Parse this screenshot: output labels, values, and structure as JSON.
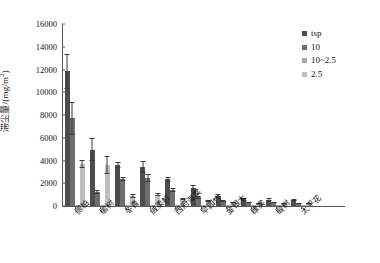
{
  "chart_data": {
    "type": "bar",
    "title": "",
    "xlabel": "",
    "ylabel": "滞尘量/(mg/m2)",
    "ylabel_base": "滞尘量/(mg/m",
    "ylabel_sup": "2",
    "ylabel_tail": ")",
    "ylim": [
      0,
      16000
    ],
    "ytick_labels": [
      "0",
      "2000",
      "4000",
      "6000",
      "8000",
      "10000",
      "12000",
      "14000",
      "16000"
    ],
    "ytick_values": [
      0,
      2000,
      4000,
      6000,
      8000,
      10000,
      12000,
      14000,
      16000
    ],
    "grid": false,
    "legend_position": "top-right",
    "categories": [
      "侧柏",
      "榆树",
      "冬青",
      "绒柔杉",
      "西府海棠",
      "早园竹",
      "金银木",
      "棣棠",
      "椴树",
      "太平花"
    ],
    "series": [
      {
        "name": "tsp",
        "color": "#4d4d4d",
        "values": [
          11850,
          4950,
          3600,
          3450,
          2350,
          1600,
          900,
          600,
          560,
          520
        ],
        "errors": [
          1550,
          1000,
          250,
          550,
          200,
          250,
          150,
          120,
          110,
          100
        ]
      },
      {
        "name": "10",
        "color": "#6e6e6e",
        "values": [
          7700,
          1250,
          2400,
          2500,
          1400,
          750,
          430,
          300,
          280,
          260
        ],
        "errors": [
          1450,
          180,
          180,
          350,
          200,
          120,
          80,
          60,
          55,
          50
        ]
      },
      {
        "name": "10~2.5",
        "color": "#a8a8a8",
        "values": [
          110,
          70,
          60,
          55,
          50,
          45,
          40,
          38,
          35,
          32
        ],
        "errors": [
          0,
          0,
          0,
          0,
          0,
          0,
          0,
          0,
          0,
          0
        ]
      },
      {
        "name": "2.5",
        "color": "#bfbfbf",
        "values": [
          3700,
          3600,
          870,
          980,
          640,
          460,
          300,
          230,
          210,
          200
        ],
        "errors": [
          350,
          800,
          180,
          140,
          100,
          90,
          60,
          50,
          45,
          40
        ]
      }
    ]
  },
  "legend": {
    "items": [
      {
        "label": "tsp",
        "color": "#4d4d4d"
      },
      {
        "label": "10",
        "color": "#6e6e6e"
      },
      {
        "label": "10~2.5",
        "color": "#a8a8a8"
      },
      {
        "label": "2.5",
        "color": "#bfbfbf"
      }
    ]
  }
}
